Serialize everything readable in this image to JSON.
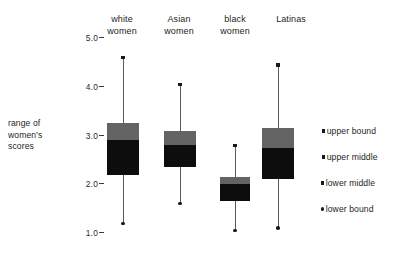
{
  "axis": {
    "y_title": "range of women's scores",
    "y_ticks": [
      {
        "label": "5.0",
        "value": 5.0
      },
      {
        "label": "4.0",
        "value": 4.0
      },
      {
        "label": "3.0",
        "value": 3.0
      },
      {
        "label": "2.0",
        "value": 2.0
      },
      {
        "label": "1.0",
        "value": 1.0
      }
    ]
  },
  "categories": [
    {
      "line1": "white",
      "line2": "women"
    },
    {
      "line1": "Asian",
      "line2": "women"
    },
    {
      "line1": "black",
      "line2": "women"
    },
    {
      "line1": "Latinas",
      "line2": ""
    }
  ],
  "legend": {
    "items": [
      {
        "label": "upper bound",
        "marker": "square",
        "color": "#1a1a1a"
      },
      {
        "label": "upper middle",
        "marker": "square",
        "color": "#1a1a1a"
      },
      {
        "label": "lower middle",
        "marker": "square",
        "color": "#1a1a1a"
      },
      {
        "label": "lower bound",
        "marker": "circle",
        "color": "#1a1a1a"
      }
    ]
  },
  "colors": {
    "upper_box": "#636363",
    "lower_box": "#0d0d0d",
    "whisker": "#5a5a5a",
    "marker": "#1a1a1a",
    "text": "#231f20",
    "background": "#ffffff"
  },
  "chart_data": {
    "type": "box",
    "title": "",
    "xlabel": "",
    "ylabel": "range of women's scores",
    "ylim": [
      1.0,
      5.0
    ],
    "grid": false,
    "legend_position": "right",
    "categories": [
      "white women",
      "Asian women",
      "black women",
      "Latinas"
    ],
    "series": [
      {
        "name": "upper bound",
        "values": [
          4.6,
          4.05,
          2.8,
          4.45
        ]
      },
      {
        "name": "upper middle",
        "values": [
          3.25,
          3.1,
          2.15,
          3.15
        ]
      },
      {
        "name": "lower middle",
        "values": [
          2.9,
          2.8,
          2.0,
          2.75
        ]
      },
      {
        "name": "lower bound",
        "values": [
          1.2,
          1.6,
          1.05,
          1.1
        ]
      }
    ],
    "boxes": [
      {
        "category": "white women",
        "upper_bound": 4.6,
        "upper_middle": 3.25,
        "middle": 2.9,
        "lower_middle": 2.2,
        "lower_bound": 1.2
      },
      {
        "category": "Asian women",
        "upper_bound": 4.05,
        "upper_middle": 3.1,
        "middle": 2.8,
        "lower_middle": 2.35,
        "lower_bound": 1.6
      },
      {
        "category": "black women",
        "upper_bound": 2.8,
        "upper_middle": 2.15,
        "middle": 2.0,
        "lower_middle": 1.65,
        "lower_bound": 1.05
      },
      {
        "category": "Latinas",
        "upper_bound": 4.45,
        "upper_middle": 3.15,
        "middle": 2.75,
        "lower_middle": 2.1,
        "lower_bound": 1.1
      }
    ]
  }
}
